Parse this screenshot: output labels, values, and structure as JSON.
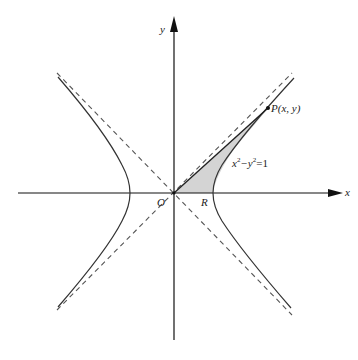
{
  "figure": {
    "colors": {
      "curve": "#333333",
      "axis": "#111111",
      "asymptote": "#555555",
      "shade": "#d4d4d4",
      "background": "#ffffff"
    }
  },
  "labels": {
    "x_axis": "x",
    "y_axis": "y",
    "origin": "O",
    "vertex": "R",
    "point": "P(x, y)",
    "equation_main": "x",
    "equation_sup1": "2",
    "equation_mid": "−y",
    "equation_sup2": "2",
    "equation_tail": "=1"
  }
}
